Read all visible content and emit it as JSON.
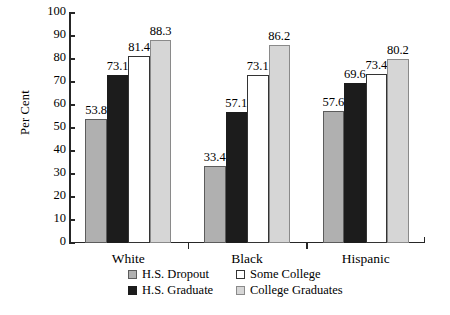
{
  "chart_data": {
    "type": "bar",
    "title": "",
    "xlabel": "",
    "ylabel": "Per Cent",
    "ylim": [
      0,
      100
    ],
    "yticks": [
      0,
      10,
      20,
      30,
      40,
      50,
      60,
      70,
      80,
      90,
      100
    ],
    "grid": false,
    "legend_position": "bottom",
    "categories": [
      "White",
      "Black",
      "Hispanic"
    ],
    "series": [
      {
        "name": "H.S. Dropout",
        "color": "#b0b0b0",
        "values": [
          53.8,
          33.4,
          57.6
        ]
      },
      {
        "name": "H.S. Graduate",
        "color": "#1c1c1c",
        "values": [
          73.1,
          57.1,
          69.6
        ]
      },
      {
        "name": "Some College",
        "color": "#ffffff",
        "values": [
          81.4,
          73.1,
          73.4
        ]
      },
      {
        "name": "College Graduates",
        "color": "#d6d6d6",
        "values": [
          88.3,
          86.2,
          80.2
        ]
      }
    ],
    "value_labels": [
      [
        "53.8",
        "73.1",
        "81.4",
        "88.3"
      ],
      [
        "33.4",
        "57.1",
        "73.1",
        "86.2"
      ],
      [
        "57.6",
        "69.6",
        "73.4",
        "80.2"
      ]
    ]
  }
}
